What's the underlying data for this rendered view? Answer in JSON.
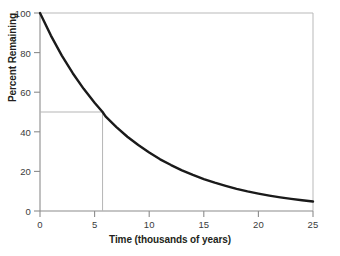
{
  "chart_data": {
    "type": "line",
    "title": "",
    "xlabel": "Time (thousands of years)",
    "ylabel": "Percent Remaining",
    "xlim": [
      0,
      25
    ],
    "ylim": [
      0,
      100
    ],
    "x_ticks": [
      0,
      5,
      10,
      15,
      20,
      25
    ],
    "x_tick_labels": [
      "0",
      "5",
      "10",
      "15",
      "20",
      "25"
    ],
    "y_ticks": [
      0,
      20,
      40,
      60,
      80,
      100
    ],
    "y_tick_labels": [
      "0",
      "20",
      "40",
      "60",
      "80",
      "100"
    ],
    "grid": false,
    "legend": null,
    "series": [
      {
        "name": "Percent remaining",
        "description": "Exponential decay, half-life 5.73 thousand years",
        "half_life": 5.73,
        "x": [
          0,
          1,
          2,
          3,
          4,
          5,
          5.73,
          6,
          7,
          8,
          9,
          10,
          11,
          12,
          13,
          14,
          15,
          16,
          17,
          18,
          19,
          20,
          21,
          22,
          23,
          24,
          25
        ],
        "y": [
          100,
          88.6,
          78.5,
          69.6,
          61.7,
          54.7,
          50,
          47.8,
          42.4,
          37.5,
          33.3,
          29.5,
          26.1,
          23.2,
          20.5,
          18.2,
          16.1,
          14.3,
          12.7,
          11.2,
          9.9,
          8.8,
          7.8,
          6.9,
          6.1,
          5.4,
          4.8
        ]
      }
    ],
    "annotations": [
      {
        "name": "half-life-guide",
        "type": "guide-lines",
        "x": 5.73,
        "y": 50,
        "description": "Thin guide lines from y-axis at 50 percent across to the curve, then down to x-axis at 5.73"
      }
    ],
    "colors": {
      "curve": "#1a1a1a",
      "axis": "#8c8c8c",
      "guide": "#b5b5b5",
      "text": "#231f20",
      "background": "#ffffff"
    }
  },
  "geometry": {
    "plot_left": 40,
    "plot_right": 313,
    "plot_top": 13,
    "plot_bottom": 211
  }
}
